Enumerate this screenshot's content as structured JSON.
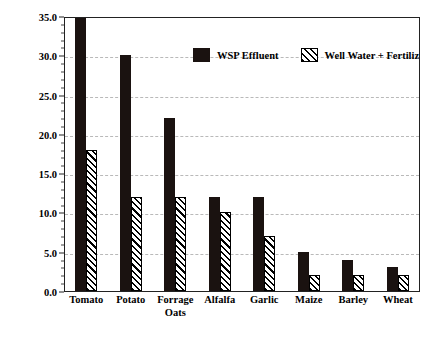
{
  "chart_data": {
    "type": "bar",
    "title": "",
    "subtitle": "",
    "xlabel": "",
    "ylabel": "Yield, tonnes/ha-yr",
    "ylim": [
      0.0,
      35.0
    ],
    "ytick_labels": [
      "0.0",
      "5.0",
      "10.0",
      "15.0",
      "20.0",
      "25.0",
      "30.0",
      "35.0"
    ],
    "ytick_values": [
      0.0,
      5.0,
      10.0,
      15.0,
      20.0,
      25.0,
      30.0,
      35.0
    ],
    "ytick_minor_interval": 1.0,
    "grid": "horizontal-dashed",
    "legend_position": "top-center-inside",
    "categories": [
      "Tomato",
      "Potato",
      "Forrage\nOats",
      "Alfalfa",
      "Garlic",
      "Maize",
      "Barley",
      "Wheat"
    ],
    "series": [
      {
        "name": "WSP Effluent",
        "style": "solid-black",
        "values": [
          35.0,
          30.0,
          22.0,
          12.0,
          12.0,
          5.0,
          4.0,
          3.0
        ],
        "clipped_at_top": [
          true,
          false,
          false,
          false,
          false,
          false,
          false,
          false
        ]
      },
      {
        "name": "Well Water + Fertilizer",
        "style": "diagonal-hatch",
        "values": [
          18.0,
          12.0,
          12.0,
          10.0,
          7.0,
          2.0,
          2.0,
          2.0
        ],
        "clipped_at_top": [
          false,
          false,
          false,
          false,
          false,
          false,
          false,
          false
        ]
      }
    ],
    "annotations": []
  },
  "legend": {
    "entries": [
      {
        "label": "WSP Effluent",
        "swatch": "solid-black-square"
      },
      {
        "label": "Well Water + Fertilizer",
        "swatch": "hatched-square"
      }
    ]
  },
  "axes": {
    "y_title": "Yield, tonnes/ha-yr"
  },
  "colors": {
    "series_1": "#1a1210",
    "series_2_lines": "#000000",
    "series_2_fill": "#ffffff",
    "axis": "#222222",
    "grid": "#b9b9b9",
    "background": "#ffffff",
    "text": "#000000"
  }
}
